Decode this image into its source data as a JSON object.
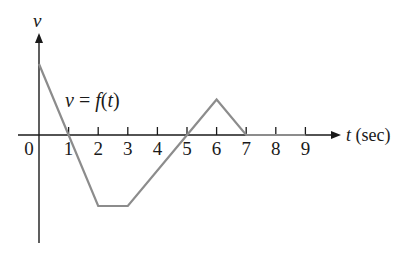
{
  "chart_data": {
    "type": "line",
    "title": "",
    "annotation": "v = f(t)",
    "xlabel": "t (sec)",
    "ylabel": "v",
    "x_ticks": [
      0,
      1,
      2,
      3,
      4,
      5,
      6,
      7,
      8,
      9
    ],
    "x_tick_labels": [
      "0",
      "1",
      "2",
      "3",
      "4",
      "5",
      "6",
      "7",
      "8",
      "9"
    ],
    "xlim": [
      0,
      9
    ],
    "ylim": [
      -3,
      3
    ],
    "grid": false,
    "legend": null,
    "series": [
      {
        "name": "v = f(t)",
        "color": "#8c8c8c",
        "points": [
          {
            "t": 0,
            "v": 2
          },
          {
            "t": 1,
            "v": 0
          },
          {
            "t": 2,
            "v": -2
          },
          {
            "t": 3,
            "v": -2
          },
          {
            "t": 5,
            "v": 0
          },
          {
            "t": 6,
            "v": 1
          },
          {
            "t": 7,
            "v": 0
          },
          {
            "t": 9,
            "v": 0
          }
        ]
      }
    ]
  },
  "labels": {
    "y_axis": "v",
    "x_axis": "t (sec)",
    "curve": "v = f(t)"
  },
  "colors": {
    "axis": "#1a1a1a",
    "curve": "#8c8c8c"
  }
}
